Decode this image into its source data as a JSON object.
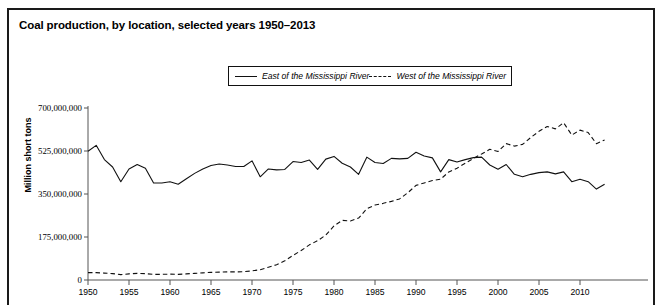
{
  "figure": {
    "title": "Coal production, by location, selected years 1950–2013"
  },
  "legend": {
    "entries": [
      {
        "label": "East of the Mississippi River",
        "style": "solid",
        "swatch": "solid-line-swatch"
      },
      {
        "label": "West of the Mississippi River",
        "style": "dashed",
        "swatch": "dashed-line-swatch"
      }
    ]
  },
  "axes": {
    "ylabel": "Million short tons",
    "ytick_labels": [
      "0",
      "175,000,000",
      "350,000,000",
      "525,000,000",
      "700,000,000"
    ],
    "xtick_labels": [
      "1950",
      "1955",
      "1960",
      "1965",
      "1970",
      "1975",
      "1980",
      "1985",
      "1990",
      "1995",
      "2000",
      "2005",
      "2010"
    ]
  },
  "colors": {
    "line": "#111111",
    "axis": "#555555",
    "frame": "#1a1a1a",
    "text": "#000000"
  },
  "chart_data": {
    "type": "line",
    "title": "Coal production, by location, selected years 1950–2013",
    "xlabel": "",
    "ylabel": "Million short tons",
    "xlim": [
      1950,
      2013
    ],
    "ylim": [
      0,
      700000000
    ],
    "yticks": [
      0,
      175000000,
      350000000,
      525000000,
      700000000
    ],
    "xticks": [
      1950,
      1955,
      1960,
      1965,
      1970,
      1975,
      1980,
      1985,
      1990,
      1995,
      2000,
      2005,
      2010
    ],
    "grid": false,
    "legend_position": "top-center",
    "x": [
      1950,
      1951,
      1952,
      1953,
      1954,
      1955,
      1956,
      1957,
      1958,
      1959,
      1960,
      1961,
      1962,
      1963,
      1964,
      1965,
      1966,
      1967,
      1968,
      1969,
      1970,
      1971,
      1972,
      1973,
      1974,
      1975,
      1976,
      1977,
      1978,
      1979,
      1980,
      1981,
      1982,
      1983,
      1984,
      1985,
      1986,
      1987,
      1988,
      1989,
      1990,
      1991,
      1992,
      1993,
      1994,
      1995,
      1996,
      1997,
      1998,
      1999,
      2000,
      2001,
      2002,
      2003,
      2004,
      2005,
      2006,
      2007,
      2008,
      2009,
      2010,
      2011,
      2012,
      2013
    ],
    "series": [
      {
        "name": "East of the Mississippi River",
        "style": "solid",
        "values": [
          524000000,
          548000000,
          490000000,
          460000000,
          400000000,
          452000000,
          470000000,
          455000000,
          395000000,
          395000000,
          400000000,
          390000000,
          412000000,
          434000000,
          452000000,
          466000000,
          472000000,
          468000000,
          462000000,
          462000000,
          485000000,
          420000000,
          452000000,
          448000000,
          450000000,
          482000000,
          478000000,
          488000000,
          450000000,
          492000000,
          503000000,
          475000000,
          460000000,
          430000000,
          500000000,
          478000000,
          474000000,
          495000000,
          493000000,
          495000000,
          520000000,
          505000000,
          497000000,
          440000000,
          490000000,
          480000000,
          490000000,
          498000000,
          500000000,
          468000000,
          451000000,
          470000000,
          430000000,
          420000000,
          430000000,
          437000000,
          440000000,
          432000000,
          440000000,
          400000000,
          410000000,
          400000000,
          370000000,
          390000000
        ]
      },
      {
        "name": "West of the Mississippi River",
        "style": "dashed",
        "values": [
          30000000,
          30000000,
          28000000,
          26000000,
          22000000,
          25000000,
          27000000,
          26000000,
          23000000,
          23000000,
          24000000,
          23000000,
          25000000,
          27000000,
          29000000,
          31000000,
          32000000,
          33000000,
          33000000,
          34000000,
          37000000,
          42000000,
          52000000,
          62000000,
          78000000,
          100000000,
          120000000,
          143000000,
          160000000,
          183000000,
          220000000,
          243000000,
          240000000,
          252000000,
          290000000,
          305000000,
          312000000,
          320000000,
          330000000,
          355000000,
          385000000,
          395000000,
          405000000,
          410000000,
          440000000,
          455000000,
          475000000,
          495000000,
          513000000,
          532000000,
          523000000,
          555000000,
          545000000,
          552000000,
          580000000,
          605000000,
          625000000,
          615000000,
          640000000,
          590000000,
          610000000,
          600000000,
          555000000,
          570000000
        ]
      }
    ]
  }
}
